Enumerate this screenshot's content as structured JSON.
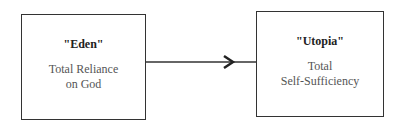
{
  "diagram": {
    "nodes": [
      {
        "id": "eden",
        "title": "\"Eden\"",
        "desc_line1": "Total Reliance",
        "desc_line2": "on God"
      },
      {
        "id": "utopia",
        "title": "\"Utopia\"",
        "desc_line1": "Total",
        "desc_line2": "Self-Sufficiency"
      }
    ],
    "edges": [
      {
        "from": "eden",
        "to": "utopia",
        "type": "arrow"
      }
    ]
  }
}
